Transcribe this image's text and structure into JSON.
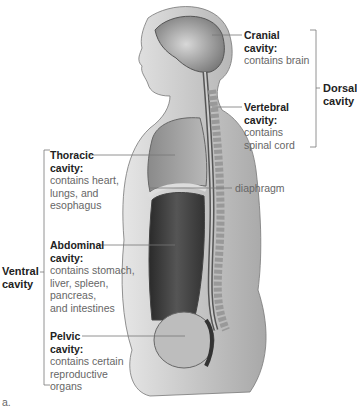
{
  "figure": {
    "panel_label": "a.",
    "groups": {
      "dorsal": {
        "line1": "Dorsal",
        "line2": "cavity"
      },
      "ventral": {
        "line1": "Ventral",
        "line2": "cavity"
      }
    },
    "labels": {
      "cranial": {
        "title1": "Cranial",
        "title2": "cavity:",
        "desc": [
          "contains brain"
        ]
      },
      "vertebral": {
        "title1": "Vertebral",
        "title2": "cavity:",
        "desc": [
          "contains",
          "spinal cord"
        ]
      },
      "thoracic": {
        "title1": "Thoracic",
        "title2": "cavity:",
        "desc": [
          "contains heart,",
          "lungs, and",
          "esophagus"
        ]
      },
      "abdominal": {
        "title1": "Abdominal",
        "title2": "cavity:",
        "desc": [
          "contains stomach,",
          "liver, spleen,",
          "pancreas,",
          "and intestines"
        ]
      },
      "pelvic": {
        "title1": "Pelvic",
        "title2": "cavity:",
        "desc": [
          "contains certain",
          "reproductive",
          "organs"
        ]
      },
      "diaphragm": "diaphragm"
    }
  }
}
